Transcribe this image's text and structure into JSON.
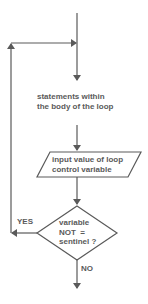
{
  "diagram": {
    "type": "flowchart",
    "colors": {
      "line": "#5a5a5a",
      "text": "#5a5a5a",
      "background": "#ffffff"
    },
    "nodes": {
      "body": {
        "shape": "text",
        "line1": "statements within",
        "line2": "the body of the loop"
      },
      "input": {
        "shape": "parallelogram",
        "line1": "input value of loop",
        "line2": "control variable"
      },
      "condition": {
        "shape": "diamond",
        "line1": "variable",
        "line2": "NOT  =",
        "line3": "sentinel ?"
      }
    },
    "edges": {
      "yes_label": "YES",
      "no_label": "NO"
    }
  }
}
